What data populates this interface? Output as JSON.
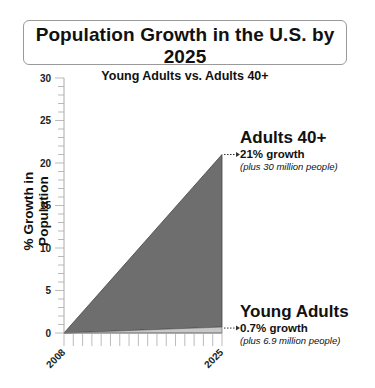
{
  "title": "Population Growth in the U.S. by 2025",
  "subtitle": "Young Adults vs. Adults 40+",
  "chart_data": {
    "type": "area",
    "title": "Population Growth in the U.S. by 2025",
    "subtitle": "Young Adults vs. Adults 40+",
    "xlabel": "",
    "ylabel": "% Growth in Population",
    "x": [
      2008,
      2025
    ],
    "x_tick_labels": [
      "2008",
      "2025"
    ],
    "y_ticks": [
      0,
      5,
      10,
      15,
      20,
      25,
      30
    ],
    "ylim": [
      0,
      30
    ],
    "grid": false,
    "legend": "none (direct labels)",
    "series": [
      {
        "name": "Adults 40+",
        "values": [
          0,
          21
        ],
        "color": "#6e6e6e",
        "growth_label": "21% growth",
        "note": "(plus 30 million people)"
      },
      {
        "name": "Young Adults",
        "values": [
          0,
          0.7
        ],
        "color": "#c8c8c8",
        "growth_label": "0.7% growth",
        "note": "(plus 6.9 million people)"
      }
    ]
  },
  "axis": {
    "y_label": "% Growth in Population",
    "y_ticks": [
      "0",
      "5",
      "10",
      "15",
      "20",
      "25",
      "30"
    ],
    "x_start": "2008",
    "x_end": "2025"
  },
  "annotations": {
    "adults40": {
      "heading": "Adults 40+",
      "growth": "21% growth",
      "note": "(plus 30 million people)"
    },
    "young": {
      "heading": "Young Adults",
      "growth": "0.7% growth",
      "note": "(plus 6.9 million people)"
    }
  }
}
